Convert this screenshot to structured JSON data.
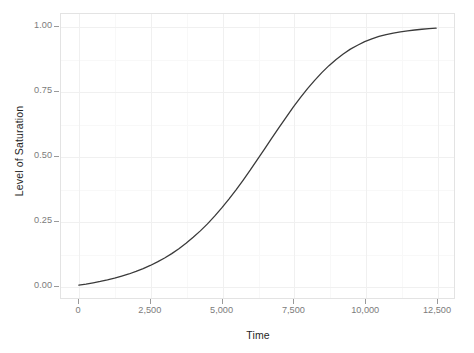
{
  "chart_data": {
    "type": "line",
    "title": "",
    "subtitle": "",
    "xlabel": "Time",
    "ylabel": "Level of Saturation",
    "xlim": [
      -625,
      13125
    ],
    "ylim": [
      -0.05,
      1.05
    ],
    "grid": true,
    "legend": "none",
    "line_color": "#3a3a3a",
    "line_width": 1.3,
    "panel_background": "#ffffff",
    "panel_border_color": "#e3e3e3",
    "grid_major_color": "#f0f0f0",
    "grid_minor_color": "#f8f8f8",
    "tick_label_color": "#7b7b7b",
    "axis_title_color": "#1f1f1f",
    "x_ticks": [
      0,
      2500,
      5000,
      7500,
      10000,
      12500
    ],
    "x_tick_labels": [
      "0",
      "2,500",
      "5,000",
      "7,500",
      "10,000",
      "12,500"
    ],
    "y_ticks": [
      0.0,
      0.25,
      0.5,
      0.75,
      1.0
    ],
    "y_tick_labels": [
      "0.00",
      "0.25",
      "0.50",
      "0.75",
      "1.00"
    ],
    "x_minor_ticks": [
      1250,
      3750,
      6250,
      8750,
      11250
    ],
    "y_minor_ticks": [
      0.125,
      0.375,
      0.625,
      0.875
    ],
    "series": [
      {
        "name": "saturation",
        "x": [
          0,
          250,
          500,
          750,
          1000,
          1250,
          1500,
          1750,
          2000,
          2250,
          2500,
          2750,
          3000,
          3250,
          3500,
          3750,
          4000,
          4250,
          4500,
          4750,
          5000,
          5250,
          5500,
          5750,
          6000,
          6250,
          6500,
          6750,
          7000,
          7250,
          7500,
          7750,
          8000,
          8250,
          8500,
          8750,
          9000,
          9250,
          9500,
          9750,
          10000,
          10250,
          10500,
          10750,
          11000,
          11250,
          11500,
          11750,
          12000,
          12250,
          12500
        ],
        "y": [
          0.0,
          0.004,
          0.009,
          0.014,
          0.02,
          0.027,
          0.035,
          0.043,
          0.053,
          0.064,
          0.076,
          0.09,
          0.105,
          0.122,
          0.141,
          0.162,
          0.185,
          0.21,
          0.237,
          0.267,
          0.299,
          0.333,
          0.369,
          0.407,
          0.446,
          0.487,
          0.528,
          0.569,
          0.61,
          0.65,
          0.689,
          0.726,
          0.761,
          0.793,
          0.823,
          0.85,
          0.874,
          0.895,
          0.914,
          0.929,
          0.943,
          0.954,
          0.963,
          0.97,
          0.976,
          0.981,
          0.985,
          0.988,
          0.991,
          0.993,
          0.995
        ]
      }
    ]
  }
}
